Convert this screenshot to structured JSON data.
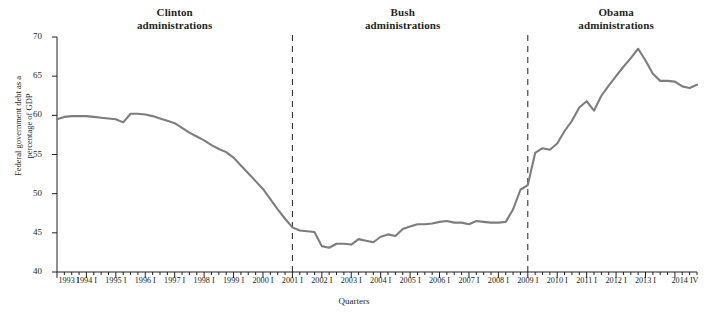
{
  "chart_data": {
    "type": "line",
    "title": "",
    "xlabel": "Quarters",
    "ylabel_line1": "Federal government debt as a",
    "ylabel_line2": "percentage of GDP",
    "ylim": [
      40,
      70
    ],
    "yticks": [
      40,
      45,
      50,
      55,
      60,
      65,
      70
    ],
    "grid": false,
    "legend": "none",
    "line_color": "#7d7d7d",
    "xtick_labels": [
      "1993 I",
      "1994 I",
      "1995 I",
      "1996 I",
      "1997 I",
      "1998 I",
      "1999 I",
      "2000 I",
      "2001 I",
      "2002 I",
      "2003 I",
      "2004 I",
      "2005 I",
      "2006 I",
      "2007 I",
      "2008 I",
      "2009 I",
      "2010 I",
      "2011 I",
      "2012 I",
      "2013 I",
      "2014 IV"
    ],
    "x_quarters": [
      "1993 I",
      "1993 II",
      "1993 III",
      "1993 IV",
      "1994 I",
      "1994 II",
      "1994 III",
      "1994 IV",
      "1995 I",
      "1995 II",
      "1995 III",
      "1995 IV",
      "1996 I",
      "1996 II",
      "1996 III",
      "1996 IV",
      "1997 I",
      "1997 II",
      "1997 III",
      "1997 IV",
      "1998 I",
      "1998 II",
      "1998 III",
      "1998 IV",
      "1999 I",
      "1999 II",
      "1999 III",
      "1999 IV",
      "2000 I",
      "2000 II",
      "2000 III",
      "2000 IV",
      "2001 I",
      "2001 II",
      "2001 III",
      "2001 IV",
      "2002 I",
      "2002 II",
      "2002 III",
      "2002 IV",
      "2003 I",
      "2003 II",
      "2003 III",
      "2003 IV",
      "2004 I",
      "2004 II",
      "2004 III",
      "2004 IV",
      "2005 I",
      "2005 II",
      "2005 III",
      "2005 IV",
      "2006 I",
      "2006 II",
      "2006 III",
      "2006 IV",
      "2007 I",
      "2007 II",
      "2007 III",
      "2007 IV",
      "2008 I",
      "2008 II",
      "2008 III",
      "2008 IV",
      "2009 I",
      "2009 II",
      "2009 III",
      "2009 IV",
      "2010 I",
      "2010 II",
      "2010 III",
      "2010 IV",
      "2011 I",
      "2011 II",
      "2011 III",
      "2011 IV",
      "2012 I",
      "2012 II",
      "2012 III",
      "2012 IV",
      "2013 I",
      "2013 II",
      "2013 III",
      "2013 IV",
      "2014 I",
      "2014 II",
      "2014 III",
      "2014 IV"
    ],
    "values": [
      59.5,
      59.8,
      59.9,
      59.9,
      59.9,
      59.8,
      59.7,
      59.6,
      59.5,
      59.1,
      60.2,
      60.2,
      60.1,
      59.9,
      59.6,
      59.3,
      59.0,
      58.4,
      57.8,
      57.3,
      56.8,
      56.2,
      55.7,
      55.3,
      54.6,
      53.6,
      52.6,
      51.6,
      50.6,
      49.3,
      48.0,
      46.8,
      45.7,
      45.3,
      45.2,
      45.1,
      43.3,
      43.1,
      43.6,
      43.6,
      43.5,
      44.2,
      44.0,
      43.8,
      44.5,
      44.8,
      44.6,
      45.5,
      45.8,
      46.1,
      46.1,
      46.2,
      46.4,
      46.5,
      46.3,
      46.3,
      46.1,
      46.5,
      46.4,
      46.3,
      46.3,
      46.4,
      48.0,
      50.5,
      51.1,
      55.2,
      55.8,
      55.6,
      56.4,
      58.0,
      59.3,
      61.0,
      61.8,
      60.6,
      62.5,
      63.8,
      65.0,
      66.2,
      67.3,
      68.5,
      67.0,
      65.3,
      64.4,
      64.4,
      64.3,
      63.7,
      63.5,
      63.9
    ],
    "annotations": [
      {
        "label_line1": "Clinton",
        "label_line2": "administrations",
        "center_quarter": "1997 I"
      },
      {
        "label_line1": "Bush",
        "label_line2": "administrations",
        "center_quarter": "2004 IV"
      },
      {
        "label_line1": "Obama",
        "label_line2": "administrations",
        "center_quarter": "2012 I"
      }
    ],
    "dividers": [
      {
        "at_quarter": "2001 I",
        "style": "dashed"
      },
      {
        "at_quarter": "2009 I",
        "style": "dashed"
      }
    ]
  }
}
